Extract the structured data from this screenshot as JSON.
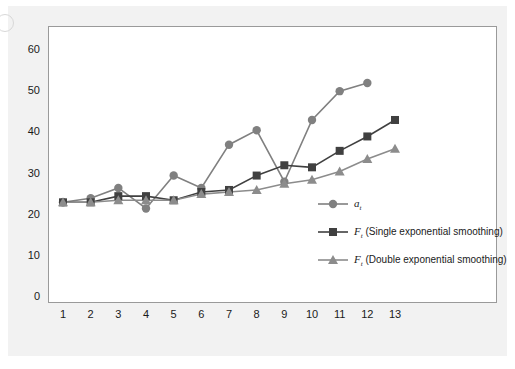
{
  "chart_data": {
    "type": "line",
    "title": "",
    "xlabel": "",
    "ylabel": "",
    "x": [
      1,
      2,
      3,
      4,
      5,
      6,
      7,
      8,
      9,
      10,
      11,
      12,
      13
    ],
    "xlim": [
      1,
      13
    ],
    "ylim": [
      0,
      60
    ],
    "yticks": [
      0,
      10,
      20,
      30,
      40,
      50,
      60
    ],
    "xticks": [
      "1",
      "2",
      "3",
      "4",
      "5",
      "6",
      "7",
      "8",
      "9",
      "10",
      "11",
      "12",
      "13"
    ],
    "grid": false,
    "legend_position": "inside-right",
    "series": [
      {
        "name": "a_t",
        "label_symbol": "a",
        "label_subscript": "t",
        "label_suffix": "",
        "marker": "circle",
        "color": "#808080",
        "values": [
          23,
          24,
          26.5,
          21.5,
          29.5,
          26.5,
          37,
          40.5,
          28,
          43,
          50,
          52,
          null
        ]
      },
      {
        "name": "F_t (Single exponential smoothing)",
        "label_symbol": "F",
        "label_subscript": "t",
        "label_suffix": "(Single exponential smoothing)",
        "marker": "square",
        "color": "#404040",
        "values": [
          23,
          23,
          24.5,
          24.5,
          23.5,
          25.5,
          26,
          29.5,
          32,
          31.5,
          35.5,
          39,
          43
        ]
      },
      {
        "name": "F_t (Double exponential smoothing)",
        "label_symbol": "F",
        "label_subscript": "t",
        "label_suffix": "(Double exponential smoothing)",
        "marker": "triangle",
        "color": "#8c8c8c",
        "values": [
          23,
          23,
          23.5,
          23.5,
          23.5,
          25,
          25.5,
          26,
          27.5,
          28.5,
          30.5,
          33.5,
          36
        ]
      }
    ]
  },
  "legend": {
    "items": [
      {
        "symbol": "a",
        "subscript": "t",
        "suffix": "",
        "marker": "circle",
        "color": "#808080"
      },
      {
        "symbol": "F",
        "subscript": "t",
        "suffix": "(Single exponential smoothing)",
        "marker": "square",
        "color": "#404040"
      },
      {
        "symbol": "F",
        "subscript": "t",
        "suffix": "(Double exponential smoothing)",
        "marker": "triangle",
        "color": "#8c8c8c"
      }
    ]
  },
  "colors": {
    "panel": "#f2f2f2",
    "plot_background": "#ffffff",
    "frame": "#9a9a9a",
    "axis_text": "#1a1a1a"
  }
}
